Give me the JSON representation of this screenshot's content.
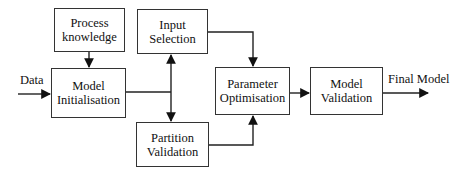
{
  "diagram": {
    "type": "flowchart",
    "nodes": [
      {
        "id": "process_knowledge",
        "lines": [
          "Process",
          "knowledge"
        ]
      },
      {
        "id": "input_selection",
        "lines": [
          "Input",
          "Selection"
        ]
      },
      {
        "id": "model_initialisation",
        "lines": [
          "Model",
          "Initialisation"
        ]
      },
      {
        "id": "partition_validation",
        "lines": [
          "Partition",
          "Validation"
        ]
      },
      {
        "id": "parameter_optimisation",
        "lines": [
          "Parameter",
          "Optimisation"
        ]
      },
      {
        "id": "model_validation",
        "lines": [
          "Model",
          "Validation"
        ]
      }
    ],
    "labels": {
      "input": "Data",
      "output": "Final Model"
    },
    "edges": [
      {
        "from": "Data",
        "to": "model_initialisation"
      },
      {
        "from": "process_knowledge",
        "to": "model_initialisation"
      },
      {
        "from": "model_initialisation",
        "to": "input_selection"
      },
      {
        "from": "model_initialisation",
        "to": "partition_validation"
      },
      {
        "from": "input_selection",
        "to": "parameter_optimisation"
      },
      {
        "from": "partition_validation",
        "to": "parameter_optimisation"
      },
      {
        "from": "parameter_optimisation",
        "to": "model_validation"
      },
      {
        "from": "model_validation",
        "to": "Final Model"
      }
    ],
    "colors": {
      "stroke": "#333333",
      "background": "#ffffff",
      "text": "#111111"
    }
  }
}
